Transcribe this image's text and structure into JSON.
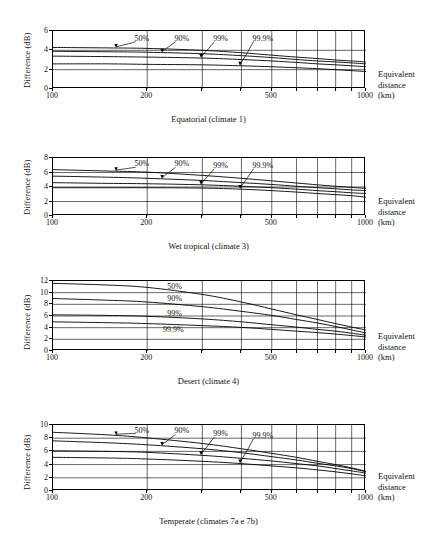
{
  "figure": {
    "axis_label_y": "Difference (dB)",
    "right_label_line1": "Equivalent",
    "right_label_line2": "distance",
    "right_label_line3": "(km)",
    "x_ticks": [
      "100",
      "200",
      "500",
      "1000"
    ],
    "series_names": [
      "50%",
      "90%",
      "99%",
      "99.9%"
    ]
  },
  "chart_data": [
    {
      "type": "line",
      "title": "Equatorial (climate 1)",
      "xlabel": "Equivalent distance (km)",
      "ylabel": "Difference (dB)",
      "xscale": "log",
      "xlim": [
        100,
        1000
      ],
      "ylim": [
        0,
        6
      ],
      "yticks": [
        0,
        2,
        4,
        6
      ],
      "xticks": [
        100,
        200,
        500,
        1000
      ],
      "gridlines_x": [
        100,
        200,
        300,
        400,
        500,
        600,
        700,
        800,
        900,
        1000
      ],
      "grid": true,
      "legend": "inline-labels",
      "x": [
        100,
        150,
        200,
        300,
        400,
        500,
        600,
        700,
        800,
        900,
        1000
      ],
      "series": [
        {
          "name": "50%",
          "values": [
            4.3,
            4.25,
            4.2,
            4.0,
            3.75,
            3.5,
            3.3,
            3.15,
            3.0,
            2.9,
            2.8
          ]
        },
        {
          "name": "90%",
          "values": [
            3.9,
            3.85,
            3.8,
            3.65,
            3.45,
            3.25,
            3.05,
            2.9,
            2.8,
            2.7,
            2.6
          ]
        },
        {
          "name": "99%",
          "values": [
            3.4,
            3.35,
            3.3,
            3.2,
            3.05,
            2.9,
            2.75,
            2.6,
            2.5,
            2.4,
            2.3
          ]
        },
        {
          "name": "99.9%",
          "values": [
            2.6,
            2.6,
            2.55,
            2.5,
            2.4,
            2.3,
            2.2,
            2.1,
            2.0,
            1.9,
            1.8
          ]
        }
      ],
      "annotations": [
        {
          "text": "50%",
          "x": 185,
          "y": 5.1
        },
        {
          "text": "90%",
          "x": 248,
          "y": 5.1
        },
        {
          "text": "99%",
          "x": 330,
          "y": 5.1
        },
        {
          "text": "99.9%",
          "x": 440,
          "y": 5.1
        }
      ]
    },
    {
      "type": "line",
      "title": "Wet tropical (climate 3)",
      "xlabel": "Equivalent distance (km)",
      "ylabel": "Difference (dB)",
      "xscale": "log",
      "xlim": [
        100,
        1000
      ],
      "ylim": [
        0,
        8
      ],
      "yticks": [
        0,
        2,
        4,
        6,
        8
      ],
      "xticks": [
        100,
        200,
        500,
        1000
      ],
      "gridlines_x": [
        100,
        200,
        300,
        400,
        500,
        600,
        700,
        800,
        900,
        1000
      ],
      "grid": true,
      "legend": "inline-labels",
      "x": [
        100,
        150,
        200,
        300,
        400,
        500,
        600,
        700,
        800,
        900,
        1000
      ],
      "series": [
        {
          "name": "50%",
          "values": [
            6.4,
            6.2,
            6.05,
            5.6,
            5.2,
            4.85,
            4.55,
            4.3,
            4.1,
            3.95,
            3.8
          ]
        },
        {
          "name": "90%",
          "values": [
            5.5,
            5.35,
            5.2,
            4.9,
            4.6,
            4.35,
            4.1,
            3.9,
            3.75,
            3.6,
            3.5
          ]
        },
        {
          "name": "99%",
          "values": [
            4.6,
            4.5,
            4.45,
            4.3,
            4.1,
            3.9,
            3.7,
            3.5,
            3.35,
            3.2,
            3.1
          ]
        },
        {
          "name": "99.9%",
          "values": [
            3.9,
            3.9,
            3.9,
            3.85,
            3.7,
            3.5,
            3.3,
            3.1,
            2.95,
            2.8,
            2.6
          ]
        }
      ],
      "annotations": [
        {
          "text": "50%",
          "x": 185,
          "y": 7.0
        },
        {
          "text": "90%",
          "x": 248,
          "y": 7.0
        },
        {
          "text": "99%",
          "x": 330,
          "y": 6.8
        },
        {
          "text": "99.9%",
          "x": 440,
          "y": 6.8
        }
      ]
    },
    {
      "type": "line",
      "title": "Desert (climate 4)",
      "xlabel": "Equivalent distance (km)",
      "ylabel": "Difference (dB)",
      "xscale": "log",
      "xlim": [
        100,
        1000
      ],
      "ylim": [
        0,
        12
      ],
      "yticks": [
        0,
        2,
        4,
        6,
        8,
        10,
        12
      ],
      "xticks": [
        100,
        200,
        500,
        1000
      ],
      "gridlines_x": [
        100,
        200,
        300,
        400,
        500,
        600,
        700,
        800,
        900,
        1000
      ],
      "grid": true,
      "legend": "inline-labels",
      "x": [
        100,
        150,
        200,
        300,
        400,
        500,
        600,
        700,
        800,
        900,
        1000
      ],
      "series": [
        {
          "name": "50%",
          "values": [
            11.6,
            11.3,
            10.9,
            9.7,
            8.4,
            7.2,
            6.2,
            5.4,
            4.7,
            4.1,
            3.6
          ]
        },
        {
          "name": "90%",
          "values": [
            9.0,
            8.7,
            8.4,
            7.6,
            6.8,
            6.1,
            5.4,
            4.8,
            4.2,
            3.6,
            3.1
          ]
        },
        {
          "name": "99%",
          "values": [
            6.2,
            6.1,
            5.95,
            5.5,
            5.0,
            4.5,
            4.1,
            3.7,
            3.4,
            3.05,
            2.7
          ]
        },
        {
          "name": "99.9%",
          "values": [
            5.0,
            4.85,
            4.7,
            4.35,
            4.05,
            3.7,
            3.4,
            3.15,
            2.9,
            2.65,
            2.4
          ]
        }
      ],
      "annotations": [
        {
          "text": "50%",
          "x": 235,
          "y": 10.8
        },
        {
          "text": "90%",
          "x": 235,
          "y": 8.7
        },
        {
          "text": "99%",
          "x": 235,
          "y": 6.2
        },
        {
          "text": "99.9%",
          "x": 228,
          "y": 3.5
        }
      ]
    },
    {
      "type": "line",
      "title": "Temperate (climates 7a e 7b)",
      "xlabel": "Equivalent distance (km)",
      "ylabel": "Difference (dB)",
      "xscale": "log",
      "xlim": [
        100,
        1000
      ],
      "ylim": [
        0,
        10
      ],
      "yticks": [
        0,
        2,
        4,
        6,
        8,
        10
      ],
      "xticks": [
        100,
        200,
        500,
        1000
      ],
      "gridlines_x": [
        100,
        200,
        300,
        400,
        500,
        600,
        700,
        800,
        900,
        1000
      ],
      "grid": true,
      "legend": "inline-labels",
      "x": [
        100,
        150,
        200,
        300,
        400,
        500,
        600,
        700,
        800,
        900,
        1000
      ],
      "series": [
        {
          "name": "50%",
          "values": [
            8.9,
            8.5,
            8.05,
            7.2,
            6.4,
            5.7,
            5.1,
            4.5,
            4.0,
            3.5,
            3.0
          ]
        },
        {
          "name": "90%",
          "values": [
            7.6,
            7.3,
            7.0,
            6.4,
            5.8,
            5.2,
            4.7,
            4.2,
            3.8,
            3.4,
            2.9
          ]
        },
        {
          "name": "99%",
          "values": [
            6.1,
            6.0,
            5.85,
            5.4,
            4.95,
            4.55,
            4.15,
            3.8,
            3.4,
            3.05,
            2.7
          ]
        },
        {
          "name": "99.9%",
          "values": [
            5.1,
            5.0,
            4.85,
            4.5,
            4.15,
            3.8,
            3.5,
            3.2,
            2.9,
            2.6,
            2.3
          ]
        }
      ],
      "annotations": [
        {
          "text": "50%",
          "x": 185,
          "y": 9.0
        },
        {
          "text": "90%",
          "x": 248,
          "y": 8.9
        },
        {
          "text": "99%",
          "x": 330,
          "y": 8.5
        },
        {
          "text": "99.9%",
          "x": 440,
          "y": 8.2
        }
      ]
    }
  ]
}
